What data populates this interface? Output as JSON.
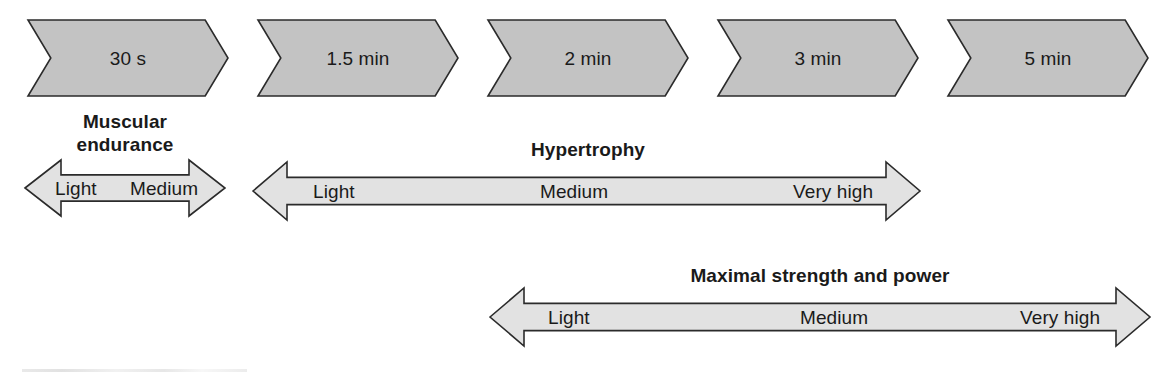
{
  "figure": {
    "type": "diagram",
    "background_color": "#ffffff",
    "chevron_fill": "#c3c3c3",
    "arrow_fill": "#e2e2e2",
    "outline_color": "#2b2b2b",
    "text_color": "#1a1a1a"
  },
  "timeline": {
    "name": "rest-interval-chevrons",
    "chevrons": [
      {
        "label": "30 s",
        "x": 28,
        "y": 20,
        "w": 200,
        "h": 76
      },
      {
        "label": "1.5 min",
        "x": 258,
        "y": 20,
        "w": 200,
        "h": 76
      },
      {
        "label": "2 min",
        "x": 488,
        "y": 20,
        "w": 200,
        "h": 76
      },
      {
        "label": "3 min",
        "x": 718,
        "y": 20,
        "w": 200,
        "h": 76
      },
      {
        "label": "5 min",
        "x": 948,
        "y": 20,
        "w": 200,
        "h": 76
      }
    ]
  },
  "bands": [
    {
      "name": "muscular-endurance",
      "title": "Muscular endurance",
      "title_lines": [
        "Muscular",
        "endurance"
      ],
      "title_x": 125,
      "title_y": 112,
      "direction": "both",
      "x": 25,
      "y": 160,
      "w": 200,
      "h": 56,
      "intensities": [
        {
          "label": "Light",
          "x": 55
        },
        {
          "label": "Medium",
          "x": 130
        }
      ]
    },
    {
      "name": "hypertrophy",
      "title": "Hypertrophy",
      "title_lines": [
        "Hypertrophy"
      ],
      "title_x": 588,
      "title_y": 140,
      "direction": "right",
      "x": 253,
      "y": 162,
      "w": 667,
      "h": 58,
      "intensities": [
        {
          "label": "Light",
          "x": 313
        },
        {
          "label": "Medium",
          "x": 540
        },
        {
          "label": "Very high",
          "x": 793
        }
      ]
    },
    {
      "name": "maximal-strength-and-power",
      "title": "Maximal strength and power",
      "title_lines": [
        "Maximal strength and power"
      ],
      "title_x": 820,
      "title_y": 266,
      "direction": "right",
      "x": 490,
      "y": 288,
      "w": 660,
      "h": 58,
      "intensities": [
        {
          "label": "Light",
          "x": 548
        },
        {
          "label": "Medium",
          "x": 800
        },
        {
          "label": "Very high",
          "x": 1020
        }
      ]
    }
  ]
}
